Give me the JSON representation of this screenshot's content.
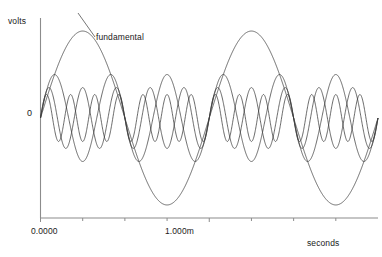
{
  "axes": {
    "y_axis_label": "volts",
    "y_zero_tick": "0",
    "x_axis_label": "seconds",
    "x_ticks": [
      "0.0000",
      "1.000m"
    ]
  },
  "annotations": {
    "fundamental": "fundamental"
  },
  "colors": {
    "background": "#ffffff",
    "axis": "#8c8c8c",
    "trace": "#3a3a3a",
    "text": "#1a1a1a"
  },
  "chart_data": {
    "type": "line",
    "title": "",
    "xlabel": "seconds",
    "ylabel": "volts",
    "xlim": [
      0,
      0.002
    ],
    "ylim": [
      -1.15,
      1.15
    ],
    "grid": false,
    "legend": false,
    "x_tick_values": [
      0,
      0.001
    ],
    "x_tick_labels": [
      "0.0000",
      "1.000m"
    ],
    "x_minor_ticks": [
      0.00025,
      0.0005,
      0.00075,
      0.00125,
      0.0015,
      0.00175
    ],
    "y_tick_values": [
      0
    ],
    "y_tick_labels": [
      "0"
    ],
    "annotations": [
      {
        "text": "fundamental",
        "x": 0.00042,
        "y": 0.78
      }
    ],
    "series": [
      {
        "name": "fundamental",
        "harmonic": 1,
        "frequency_hz": 1000,
        "amplitude_volts": 1.0,
        "phase_deg": 0,
        "cycles_shown": 2
      },
      {
        "name": "3rd harmonic",
        "harmonic": 3,
        "frequency_hz": 3000,
        "amplitude_volts": 0.5,
        "phase_deg": 0,
        "cycles_shown": 6
      },
      {
        "name": "5th harmonic",
        "harmonic": 5,
        "frequency_hz": 5000,
        "amplitude_volts": 0.35,
        "phase_deg": 0,
        "cycles_shown": 10
      },
      {
        "name": "7th harmonic",
        "harmonic": 7,
        "frequency_hz": 7000,
        "amplitude_volts": 0.27,
        "phase_deg": 0,
        "cycles_shown": 14
      }
    ]
  }
}
